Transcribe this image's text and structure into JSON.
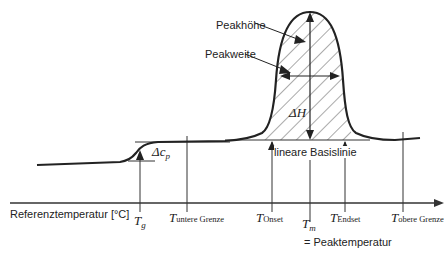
{
  "diagram": {
    "xaxis_label": "Referenztemperatur  [°C]",
    "labels": {
      "peak_height": "Peakhöhe",
      "peak_width": "Peakweite",
      "baseline": "lineare Basislinie",
      "delta_h": "ΔH",
      "delta_cp_main": "Δc",
      "delta_cp_sub": "p",
      "peak_temperature": "= Peaktemperatur"
    },
    "ticks": [
      {
        "id": "tg",
        "symbol": "T",
        "subscript": "g",
        "x": 140
      },
      {
        "id": "t-untere",
        "symbol": "T",
        "subscript": "untere Grenze",
        "x": 187
      },
      {
        "id": "t-onset",
        "symbol": "T",
        "subscript": "Onset",
        "x": 272
      },
      {
        "id": "tm",
        "symbol": "T",
        "subscript": "m",
        "x": 310
      },
      {
        "id": "t-endset",
        "symbol": "T",
        "subscript": "Endset",
        "x": 345
      },
      {
        "id": "t-obere",
        "symbol": "T",
        "subscript": "obere Grenze",
        "x": 403
      }
    ],
    "colors": {
      "curve": "#222222",
      "lines": "#333333",
      "hatch": "#555555",
      "text": "#222222"
    }
  }
}
